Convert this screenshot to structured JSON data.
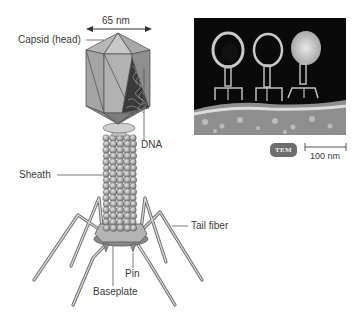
{
  "diagram": {
    "labels": {
      "dimension": "65 nm",
      "capsid": "Capsid (head)",
      "dna": "DNA",
      "sheath": "Sheath",
      "tail_fiber": "Tail fiber",
      "pin": "Pin",
      "baseplate": "Baseplate"
    },
    "micrograph": {
      "badge": "TEM",
      "scale_bar_label": "100 nm"
    },
    "colors": {
      "capsid_light": "#b8b8b8",
      "capsid_mid": "#9a9a9a",
      "capsid_dark": "#7a7a7a",
      "sheath_bead": "#a8a8a8",
      "label_text": "#3a3a3a",
      "leader_line": "#555555",
      "tem_bg": "#0a0a0a",
      "badge_bg": "#6e6e6e"
    }
  }
}
